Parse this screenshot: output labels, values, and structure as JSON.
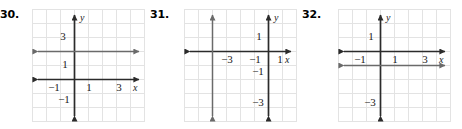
{
  "page": {
    "background": "#ffffff",
    "axis_color": "#2b2b2b",
    "line_color": "#5a5a5a",
    "grid_color": "#e3e3e3",
    "label_color": "#1a1a1a"
  },
  "problems": [
    {
      "number": "30.",
      "graph": {
        "x_axis_label": "x",
        "y_axis_label": "y",
        "x_ticks": [
          {
            "label": "−1",
            "value": -1
          },
          {
            "label": "1",
            "value": 1
          },
          {
            "label": "3",
            "value": 3
          }
        ],
        "y_ticks": [
          {
            "label": "3",
            "value": 3
          },
          {
            "label": "1",
            "value": 1
          },
          {
            "label": "−1",
            "value": -1
          }
        ],
        "x_range": [
          -3,
          5
        ],
        "y_range": [
          -3,
          5
        ],
        "plotted_line": {
          "orientation": "horizontal",
          "equation": "y = 2",
          "value": 2,
          "arrows": "both"
        }
      }
    },
    {
      "number": "31.",
      "graph": {
        "x_axis_label": "x",
        "y_axis_label": "y",
        "x_ticks": [
          {
            "label": "−3",
            "value": -3
          },
          {
            "label": "−1",
            "value": -1
          },
          {
            "label": "1",
            "value": 1
          }
        ],
        "y_ticks": [
          {
            "label": "1",
            "value": 1
          },
          {
            "label": "−1",
            "value": -1
          },
          {
            "label": "−3",
            "value": -3
          }
        ],
        "x_range": [
          -6,
          2
        ],
        "y_range": [
          -5,
          3
        ],
        "plotted_line": {
          "orientation": "vertical",
          "equation": "x = −4",
          "value": -4,
          "arrows": "both"
        }
      }
    },
    {
      "number": "32.",
      "graph": {
        "x_axis_label": "x",
        "y_axis_label": "y",
        "x_ticks": [
          {
            "label": "−1",
            "value": -1
          },
          {
            "label": "1",
            "value": 1
          },
          {
            "label": "3",
            "value": 3
          }
        ],
        "y_ticks": [
          {
            "label": "1",
            "value": 1
          },
          {
            "label": "−3",
            "value": -3
          }
        ],
        "x_range": [
          -3,
          5
        ],
        "y_range": [
          -5,
          3
        ],
        "plotted_line": {
          "orientation": "horizontal",
          "equation": "y = −1",
          "value": -1,
          "arrows": "both"
        }
      }
    }
  ]
}
